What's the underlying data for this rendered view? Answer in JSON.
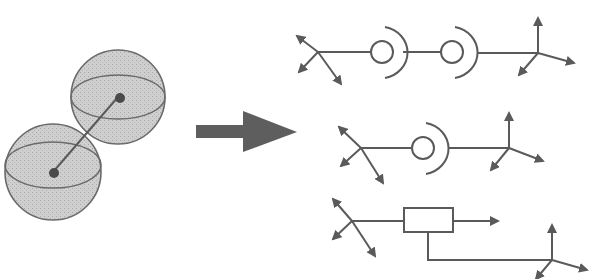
{
  "diagram": {
    "colors": {
      "stroke": "#555555",
      "arrow_fill": "#5a5a5a",
      "sphere_fill": "#c8c8c8",
      "sphere_stroke": "#6a6a6a",
      "background": "#ffffff"
    },
    "left_model": {
      "label": "two-sphere-body",
      "spheres": [
        {
          "name": "upper-sphere",
          "cx": 118,
          "cy": 97,
          "r": 47
        },
        {
          "name": "lower-sphere",
          "cx": 53,
          "cy": 172,
          "r": 48
        }
      ],
      "link": {
        "from": [
          53,
          172
        ],
        "to": [
          118,
          97
        ]
      }
    },
    "transform_arrow": {
      "label": "maps-to",
      "direction": "right"
    },
    "representations": [
      {
        "name": "double-ball-socket-chain",
        "elements": [
          "coordinate-frame",
          "ball-socket-joint",
          "ball-socket-joint",
          "coordinate-frame"
        ]
      },
      {
        "name": "single-ball-socket-chain",
        "elements": [
          "coordinate-frame",
          "ball-socket-joint",
          "coordinate-frame"
        ]
      },
      {
        "name": "block-element-chain",
        "elements": [
          "coordinate-frame",
          "block-element",
          "output-arrow",
          "coordinate-frame"
        ]
      }
    ]
  }
}
